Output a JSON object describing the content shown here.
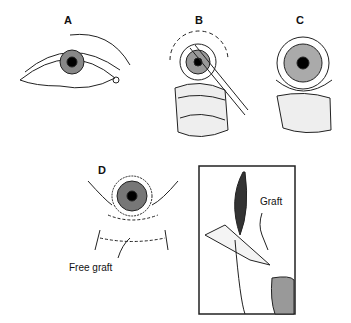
{
  "figure": {
    "panels": [
      {
        "id": "A",
        "label": "A"
      },
      {
        "id": "B",
        "label": "B"
      },
      {
        "id": "C",
        "label": "C"
      },
      {
        "id": "D",
        "label": "D",
        "caption": "Free graft"
      },
      {
        "id": "E",
        "label": "",
        "caption": "Graft"
      }
    ]
  }
}
